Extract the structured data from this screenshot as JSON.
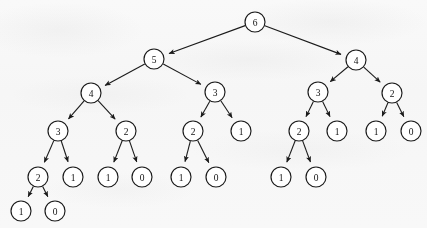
{
  "figure": {
    "type": "tree-diagram",
    "node_radius": 10,
    "colors": {
      "background": "#fbfbfb",
      "stroke": "#1a1a1a",
      "node_fill": "#ffffff",
      "label": "#111111"
    }
  },
  "tree": {
    "root_id": "n0",
    "nodes": [
      {
        "id": "n0",
        "label": "6",
        "x": 255,
        "y": 22,
        "depth": 0
      },
      {
        "id": "n1",
        "label": "5",
        "x": 154,
        "y": 59,
        "depth": 1
      },
      {
        "id": "n2",
        "label": "4",
        "x": 356,
        "y": 60,
        "depth": 1
      },
      {
        "id": "n3",
        "label": "4",
        "x": 91,
        "y": 93,
        "depth": 2
      },
      {
        "id": "n4",
        "label": "3",
        "x": 215,
        "y": 92,
        "depth": 2
      },
      {
        "id": "n5",
        "label": "3",
        "x": 318,
        "y": 92,
        "depth": 2
      },
      {
        "id": "n6",
        "label": "2",
        "x": 392,
        "y": 93,
        "depth": 2
      },
      {
        "id": "n7",
        "label": "3",
        "x": 58,
        "y": 131,
        "depth": 3
      },
      {
        "id": "n8",
        "label": "2",
        "x": 126,
        "y": 131,
        "depth": 3
      },
      {
        "id": "n9",
        "label": "2",
        "x": 193,
        "y": 131,
        "depth": 3
      },
      {
        "id": "n10",
        "label": "1",
        "x": 241,
        "y": 131,
        "depth": 3
      },
      {
        "id": "n11",
        "label": "2",
        "x": 299,
        "y": 131,
        "depth": 3
      },
      {
        "id": "n12",
        "label": "1",
        "x": 337,
        "y": 131,
        "depth": 3
      },
      {
        "id": "n13",
        "label": "1",
        "x": 376,
        "y": 131,
        "depth": 3
      },
      {
        "id": "n14",
        "label": "0",
        "x": 411,
        "y": 131,
        "depth": 3
      },
      {
        "id": "n15",
        "label": "2",
        "x": 38,
        "y": 177,
        "depth": 4
      },
      {
        "id": "n16",
        "label": "1",
        "x": 73,
        "y": 177,
        "depth": 4
      },
      {
        "id": "n17",
        "label": "1",
        "x": 108,
        "y": 177,
        "depth": 4
      },
      {
        "id": "n18",
        "label": "0",
        "x": 142,
        "y": 177,
        "depth": 4
      },
      {
        "id": "n19",
        "label": "1",
        "x": 181,
        "y": 177,
        "depth": 4
      },
      {
        "id": "n20",
        "label": "0",
        "x": 216,
        "y": 177,
        "depth": 4
      },
      {
        "id": "n21",
        "label": "1",
        "x": 281,
        "y": 177,
        "depth": 4
      },
      {
        "id": "n22",
        "label": "0",
        "x": 316,
        "y": 177,
        "depth": 4
      },
      {
        "id": "n23",
        "label": "1",
        "x": 21,
        "y": 211,
        "depth": 5
      },
      {
        "id": "n24",
        "label": "0",
        "x": 55,
        "y": 211,
        "depth": 5
      }
    ],
    "edges": [
      {
        "from": "n0",
        "to": "n1",
        "arrow": "to-child"
      },
      {
        "from": "n0",
        "to": "n2",
        "arrow": "to-child"
      },
      {
        "from": "n1",
        "to": "n3",
        "arrow": "to-child"
      },
      {
        "from": "n1",
        "to": "n4",
        "arrow": "to-child"
      },
      {
        "from": "n2",
        "to": "n5",
        "arrow": "to-child"
      },
      {
        "from": "n2",
        "to": "n6",
        "arrow": "to-child"
      },
      {
        "from": "n3",
        "to": "n7",
        "arrow": "to-child"
      },
      {
        "from": "n3",
        "to": "n8",
        "arrow": "to-child"
      },
      {
        "from": "n4",
        "to": "n9",
        "arrow": "to-child"
      },
      {
        "from": "n4",
        "to": "n10",
        "arrow": "to-child"
      },
      {
        "from": "n5",
        "to": "n11",
        "arrow": "to-child"
      },
      {
        "from": "n5",
        "to": "n12",
        "arrow": "to-child"
      },
      {
        "from": "n6",
        "to": "n13",
        "arrow": "to-child"
      },
      {
        "from": "n6",
        "to": "n14",
        "arrow": "to-child"
      },
      {
        "from": "n7",
        "to": "n15",
        "arrow": "to-child"
      },
      {
        "from": "n7",
        "to": "n16",
        "arrow": "to-child"
      },
      {
        "from": "n8",
        "to": "n17",
        "arrow": "to-child"
      },
      {
        "from": "n8",
        "to": "n18",
        "arrow": "to-child"
      },
      {
        "from": "n9",
        "to": "n19",
        "arrow": "to-child"
      },
      {
        "from": "n9",
        "to": "n20",
        "arrow": "to-child"
      },
      {
        "from": "n11",
        "to": "n21",
        "arrow": "to-child"
      },
      {
        "from": "n11",
        "to": "n22",
        "arrow": "to-child"
      },
      {
        "from": "n15",
        "to": "n23",
        "arrow": "to-child"
      },
      {
        "from": "n15",
        "to": "n24",
        "arrow": "to-child"
      }
    ]
  }
}
